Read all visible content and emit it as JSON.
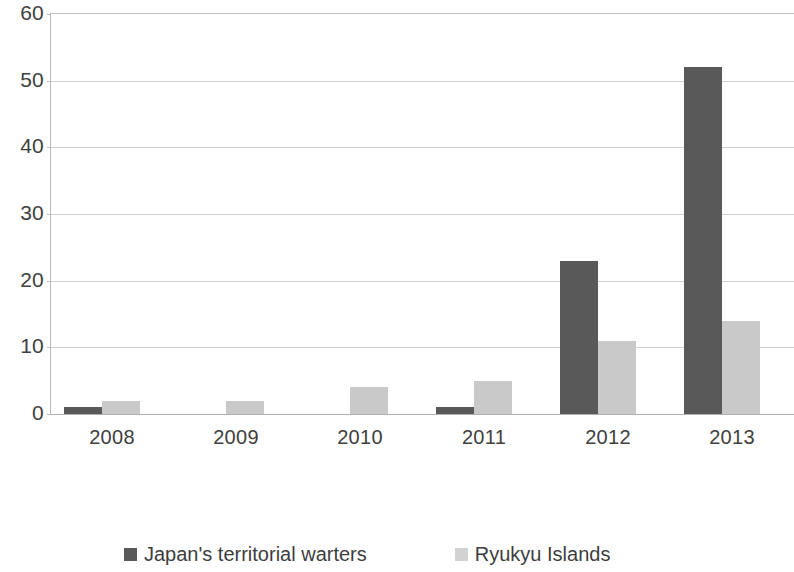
{
  "chart_data": {
    "type": "bar",
    "title": "",
    "subtitle": "",
    "xlabel": "",
    "ylabel": "",
    "categories": [
      "2008",
      "2009",
      "2010",
      "2011",
      "2012",
      "2013"
    ],
    "series": [
      {
        "name": "Japan's territorial warters",
        "color": "#595959",
        "values": [
          1,
          0,
          0,
          1,
          23,
          52
        ]
      },
      {
        "name": "Ryukyu Islands",
        "color": "#c9c9c9",
        "values": [
          2,
          2,
          4,
          5,
          11,
          14
        ]
      }
    ],
    "ylim": [
      0,
      60
    ],
    "y_ticks": [
      0,
      10,
      20,
      30,
      40,
      50,
      60
    ],
    "y_tick_labels": [
      "0",
      "10",
      "20",
      "30",
      "40",
      "50",
      "60"
    ],
    "grid": "horizontal",
    "legend_position": "bottom"
  },
  "legend": {
    "items": [
      {
        "label": "Japan's territorial warters",
        "color": "#595959"
      },
      {
        "label": "Ryukyu Islands",
        "color": "#d2d2d2"
      }
    ]
  },
  "colors": {
    "series_dark": "#595959",
    "series_light": "#c9c9c9",
    "gridline": "#cfcfcf",
    "axis": "#b8b8b8",
    "text": "#404040",
    "background": "#ffffff"
  }
}
